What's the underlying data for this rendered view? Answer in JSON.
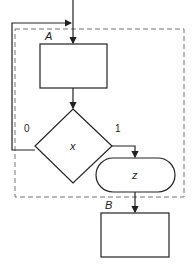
{
  "diagram": {
    "type": "flowchart",
    "block_labels": {
      "a": "A",
      "b": "B"
    },
    "decision": {
      "label": "x",
      "false_branch": "0",
      "true_branch": "1"
    },
    "terminal": {
      "label": "z"
    },
    "colors": {
      "stroke": "#222222",
      "dashed": "#777777",
      "background": "#ffffff"
    }
  }
}
